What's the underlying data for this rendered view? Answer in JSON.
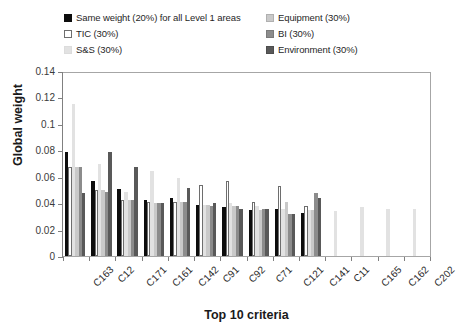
{
  "chart_data": {
    "type": "bar",
    "title": "",
    "xlabel": "Top 10 criteria",
    "ylabel": "Global weight",
    "ylim": [
      0,
      0.14
    ],
    "ytick_values": [
      "0.14",
      "0.12",
      "0.1",
      "0.08",
      "0.06",
      "0.04",
      "0.02",
      "0"
    ],
    "grid": false,
    "legend_position": "top",
    "categories": [
      "C163",
      "C12",
      "C171",
      "C161",
      "C142",
      "C91",
      "C92",
      "C71",
      "C121",
      "C141",
      "C11",
      "C165",
      "C162",
      "C202"
    ],
    "series": [
      {
        "name": "Same weight (20%) for all Level 1 areas",
        "color": "#0d0d0d",
        "values": [
          0.079,
          0.057,
          0.051,
          0.043,
          0.044,
          0.039,
          0.037,
          0.035,
          0.036,
          0.033,
          null,
          null,
          null,
          null
        ]
      },
      {
        "name": "TIC (30%)",
        "color": "#ffffff",
        "values": [
          0.068,
          0.05,
          0.043,
          0.041,
          0.041,
          0.054,
          0.057,
          0.041,
          0.053,
          0.038,
          null,
          null,
          null,
          null
        ]
      },
      {
        "name": "S&S (30%)",
        "color": "#e2e2e2",
        "values": [
          0.116,
          0.07,
          0.049,
          0.065,
          0.059,
          0.039,
          0.04,
          0.038,
          0.036,
          0.035,
          0.034,
          0.037,
          0.036,
          0.036
        ]
      },
      {
        "name": "Equipment (30%)",
        "color": "#c9c9c9",
        "values": [
          0.068,
          0.05,
          0.043,
          0.04,
          0.041,
          0.039,
          0.038,
          0.035,
          0.041,
          0.035,
          null,
          null,
          null,
          null
        ]
      },
      {
        "name": "BI (30%)",
        "color": "#8c8c8c",
        "values": [
          0.068,
          0.049,
          0.043,
          0.04,
          0.041,
          0.038,
          0.038,
          0.036,
          0.032,
          0.048,
          null,
          null,
          null,
          null
        ]
      },
      {
        "name": "Environment (30%)",
        "color": "#595959",
        "values": [
          0.048,
          0.079,
          0.068,
          0.04,
          0.052,
          0.04,
          0.036,
          0.036,
          0.032,
          0.044,
          null,
          null,
          null,
          null
        ]
      }
    ]
  },
  "legend": {
    "items": [
      {
        "label": "Same weight (20%) for all Level 1 areas",
        "swatch": "#0d0d0d",
        "border": "#0d0d0d"
      },
      {
        "label": "Equipment (30%)",
        "swatch": "#c9c9c9",
        "border": "#b0b0b0"
      },
      {
        "label": "TIC (30%)",
        "swatch": "#ffffff",
        "border": "#6e6e6e"
      },
      {
        "label": "BI (30%)",
        "swatch": "#8c8c8c",
        "border": "#7a7a7a"
      },
      {
        "label": "S&S (30%)",
        "swatch": "#e2e2e2",
        "border": "#dcdcdc"
      },
      {
        "label": "Environment (30%)",
        "swatch": "#595959",
        "border": "#4d4d4d"
      }
    ],
    "order": [
      0,
      1,
      2,
      3,
      4,
      5
    ]
  }
}
